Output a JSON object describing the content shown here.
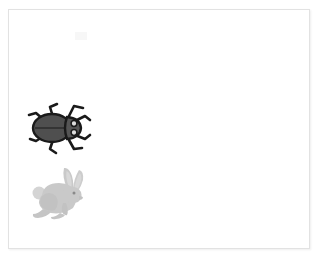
{
  "scene": {
    "title": "Beetle and rabbit illustration card",
    "background_color": "#ffffff",
    "frame": {
      "name": "card-frame",
      "border_color": "#e2e2e2",
      "fill_color": "#ffffff",
      "shadow_color": "rgba(0,0,0,0.07)"
    },
    "artifact": {
      "name": "scan-artifact",
      "color": "#f4f4f4",
      "description": "faint smudge near top of card"
    }
  },
  "figures": [
    {
      "id": "beetle",
      "label": "Beetle",
      "icon_name": "beetle-icon",
      "facing": "right",
      "position": {
        "x": 14,
        "y": 86
      },
      "size": {
        "width": 72,
        "height": 62
      },
      "colors": {
        "body": "#4f4f4f",
        "body_light": "#5c5c5c",
        "outline": "#1a1a1a",
        "eye": "#d8d8d8",
        "legs": "#262626"
      },
      "parts": [
        "head",
        "eyes",
        "thorax",
        "abdomen",
        "six-legs",
        "antennae"
      ]
    },
    {
      "id": "rabbit",
      "label": "Rabbit",
      "icon_name": "rabbit-icon",
      "facing": "right",
      "position": {
        "x": 20,
        "y": 155
      },
      "size": {
        "width": 62,
        "height": 58
      },
      "colors": {
        "body": "#c9c9c9",
        "body_shade": "#bdbdbd",
        "inner_ear": "#d6d6d6",
        "eye": "#8a8a8a",
        "tail": "#d2d2d2"
      },
      "parts": [
        "ears",
        "head",
        "eye",
        "body",
        "front-legs",
        "hind-leg",
        "tail"
      ]
    }
  ]
}
